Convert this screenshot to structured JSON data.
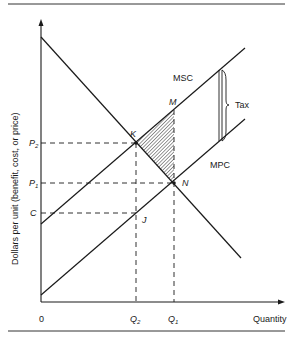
{
  "diagram": {
    "type": "economics-externality-tax",
    "y_axis_label": "Dollars per unit (benefit, cost, or price)",
    "x_axis_label": "Quantity",
    "origin_label": "0",
    "curves": {
      "msc": "MSC",
      "mpc": "MPC",
      "demand": ""
    },
    "points": {
      "K": "K",
      "M": "M",
      "N": "N",
      "J": "J"
    },
    "y_ticks": {
      "p2": "P",
      "p2_sub": "2",
      "p1": "P",
      "p1_sub": "1",
      "c": "C"
    },
    "x_ticks": {
      "q2": "Q",
      "q2_sub": "2",
      "q1": "Q",
      "q1_sub": "1"
    },
    "annotation": {
      "tax": "Tax"
    },
    "colors": {
      "line": "#1a1a1a",
      "hatch": "#555555",
      "background": "#ffffff"
    }
  }
}
